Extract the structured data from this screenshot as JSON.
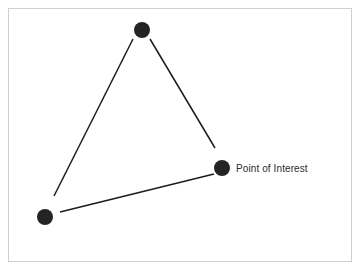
{
  "canvas": {
    "width": 360,
    "height": 273,
    "background_color": "#ffffff",
    "border_color": "#cfcfcf"
  },
  "diagram": {
    "type": "node-link-graph",
    "node_color": "#242424",
    "edge_color": "#1c1c1c",
    "label_color": "#2b2b2b",
    "nodes": [
      {
        "id": "top",
        "label": "",
        "cx": 142,
        "cy": 30,
        "r": 8
      },
      {
        "id": "bottom-left",
        "label": "",
        "cx": 45,
        "cy": 217,
        "r": 8
      },
      {
        "id": "point-of-interest",
        "label": "Point of Interest",
        "cx": 222,
        "cy": 168,
        "r": 8
      }
    ],
    "edges": [
      {
        "from": "top",
        "to": "bottom-left",
        "x1": 133,
        "y1": 39,
        "x2": 54,
        "y2": 196
      },
      {
        "from": "top",
        "to": "point-of-interest",
        "x1": 150,
        "y1": 39,
        "x2": 215,
        "y2": 148
      },
      {
        "from": "bottom-left",
        "to": "point-of-interest",
        "x1": 60,
        "y1": 212,
        "x2": 214,
        "y2": 174
      }
    ],
    "labels": [
      {
        "for": "point-of-interest",
        "text": "Point of Interest",
        "x": 236,
        "y": 163
      }
    ]
  }
}
